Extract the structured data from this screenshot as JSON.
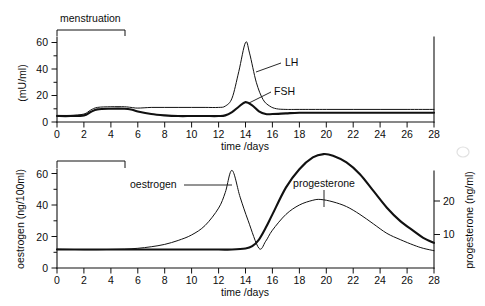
{
  "figure": {
    "background_color": "#ffffff",
    "ink_color": "#111111"
  },
  "chart_data": [
    {
      "type": "line",
      "panel": "top",
      "title": "",
      "xlabel": "time /days",
      "ylabel": "(mU/ml)",
      "xlim": [
        0,
        28
      ],
      "ylim": [
        0,
        65
      ],
      "xticks": [
        0,
        2,
        4,
        6,
        8,
        10,
        12,
        14,
        16,
        18,
        20,
        22,
        24,
        26,
        28
      ],
      "xtick_labels": [
        "0",
        "2",
        "4",
        "6",
        "8",
        "10",
        "12",
        "14",
        "16",
        "18",
        "20",
        "22",
        "24",
        "26",
        "28"
      ],
      "yticks": [
        0,
        10,
        20,
        30,
        40,
        50,
        60
      ],
      "ytick_labels": [
        "0",
        "20",
        "40",
        "60"
      ],
      "ytick_labeled": [
        0,
        20,
        40,
        60
      ],
      "grid": false,
      "legend": "inline-labels",
      "annotations": [
        {
          "text": "menstruation",
          "day_start": 0,
          "day_end": 5,
          "kind": "bracket"
        }
      ],
      "series": [
        {
          "name": "LH",
          "label": "LH",
          "line_weight": "thin",
          "x": [
            0,
            1,
            2,
            2.5,
            3,
            4,
            5,
            5.5,
            6,
            7,
            8,
            9,
            10,
            11,
            12,
            12.5,
            13,
            13.5,
            14,
            14.3,
            14.8,
            15.3,
            15.8,
            16.3,
            17,
            18,
            20,
            22,
            24,
            26,
            28
          ],
          "y": [
            5,
            5,
            6,
            9,
            11,
            11.5,
            11.5,
            11,
            10.5,
            11,
            11,
            11,
            11,
            11,
            11,
            12,
            18,
            38,
            60,
            52,
            30,
            17,
            12,
            10,
            9.5,
            9.5,
            9.5,
            9.5,
            9.5,
            9.5,
            9.5
          ]
        },
        {
          "name": "FSH",
          "label": "FSH",
          "line_weight": "thick",
          "x": [
            0,
            1,
            2,
            2.5,
            3,
            4,
            5,
            5.5,
            6,
            7,
            8,
            9,
            10,
            11,
            12,
            12.5,
            13,
            13.5,
            14,
            14.5,
            15,
            15.5,
            16,
            17,
            18,
            20,
            22,
            24,
            26,
            28
          ],
          "y": [
            4.5,
            4.5,
            5,
            7.5,
            9.5,
            10,
            10,
            9.5,
            8,
            6,
            5,
            4.5,
            4.5,
            4.5,
            4.5,
            5,
            7.5,
            11.5,
            15,
            12.5,
            8,
            6,
            6,
            6.5,
            7,
            7,
            7,
            7,
            7,
            7
          ]
        }
      ]
    },
    {
      "type": "line",
      "panel": "bottom",
      "title": "",
      "xlabel": "time /days",
      "ylabel": "oestrogen  (ng/100ml)",
      "ylabel_right": "progesterone (ng/ml)",
      "xlim": [
        0,
        28
      ],
      "ylim": [
        0,
        65
      ],
      "ylim_right": [
        0,
        29
      ],
      "xticks": [
        0,
        2,
        4,
        6,
        8,
        10,
        12,
        14,
        16,
        18,
        20,
        22,
        24,
        26,
        28
      ],
      "xtick_labels": [
        "0",
        "2",
        "4",
        "6",
        "8",
        "10",
        "12",
        "14",
        "16",
        "18",
        "20",
        "22",
        "24",
        "26",
        "28"
      ],
      "yticks": [
        0,
        10,
        20,
        30,
        40,
        50,
        60
      ],
      "ytick_labels": [
        "0",
        "20",
        "40",
        "60"
      ],
      "ytick_labeled": [
        0,
        20,
        40,
        60
      ],
      "yticks_right": [
        10,
        20
      ],
      "ytick_labels_right": [
        "10",
        "20"
      ],
      "grid": false,
      "legend": "inline-labels",
      "annotations": [
        {
          "text": "",
          "day_start": 0,
          "day_end": 5,
          "kind": "bracket"
        }
      ],
      "series": [
        {
          "name": "oestrogen",
          "label": "oestrogen",
          "line_weight": "thin",
          "axis": "left",
          "x": [
            0,
            1,
            2,
            3,
            4,
            5,
            6,
            7,
            8,
            9,
            10,
            11,
            12,
            12.5,
            13,
            13.6,
            14.2,
            15,
            15.5,
            16,
            17,
            18,
            19,
            19.6,
            20.5,
            21.5,
            22.5,
            23.5,
            24.5,
            25.5,
            26.5,
            27.2,
            28
          ],
          "y": [
            12,
            11.8,
            11.6,
            11.6,
            11.8,
            12,
            12.5,
            13.5,
            15,
            17.5,
            21,
            27,
            38,
            48,
            62,
            45,
            30,
            12.5,
            17,
            24,
            34,
            40,
            43,
            43.5,
            42,
            39,
            34,
            28,
            22,
            18,
            14.5,
            12.5,
            11
          ]
        },
        {
          "name": "progesterone",
          "label": "progesterone",
          "line_weight": "thick",
          "axis": "right",
          "x": [
            0,
            2,
            4,
            6,
            8,
            10,
            12,
            13,
            14,
            14.5,
            15,
            15.5,
            16,
            17,
            18,
            19,
            19.8,
            20.5,
            21.5,
            22.5,
            23.5,
            24.5,
            25.5,
            26.5,
            27.2,
            28
          ],
          "y": [
            5.5,
            5.5,
            5.5,
            5.5,
            5.5,
            5.5,
            5.5,
            5.5,
            5.8,
            6.5,
            8.5,
            12,
            16,
            24,
            29.5,
            33,
            34,
            33.5,
            31.5,
            28,
            23,
            18,
            14,
            11,
            9,
            7.5
          ]
        }
      ]
    }
  ],
  "labels": {
    "menstruation": "menstruation",
    "lh": "LH",
    "fsh": "FSH",
    "oestrogen": "oestrogen",
    "progesterone": "progesterone",
    "time_axis": "time /days",
    "top_y_axis": "(mU/ml)",
    "bottom_y_axis_left": "oestrogen  (ng/100ml)",
    "bottom_y_axis_right": "progesterone (ng/ml)",
    "x_ticks": [
      "0",
      "2",
      "4",
      "6",
      "8",
      "10",
      "12",
      "14",
      "16",
      "18",
      "20",
      "22",
      "24",
      "26",
      "28"
    ],
    "y_ticks_top": [
      "0",
      "20",
      "40",
      "60"
    ],
    "y_ticks_bottom_left": [
      "0",
      "20",
      "40",
      "60"
    ],
    "y_ticks_bottom_right": [
      "10",
      "20"
    ]
  }
}
